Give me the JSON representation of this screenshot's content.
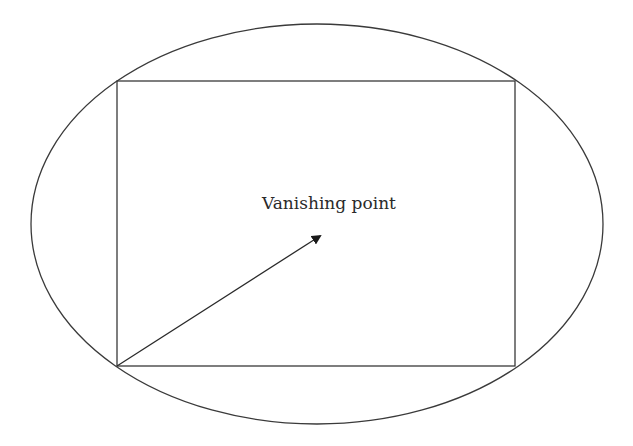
{
  "diagram": {
    "label": "Vanishing point",
    "ellipse": {
      "cx": 317,
      "cy": 224,
      "rx": 286,
      "ry": 200
    },
    "rectangle": {
      "x": 117,
      "y": 81,
      "width": 398,
      "height": 285
    },
    "arrow": {
      "x1": 117,
      "y1": 366,
      "x2": 322,
      "y2": 234
    },
    "stroke_color": "#3a3a3a"
  }
}
